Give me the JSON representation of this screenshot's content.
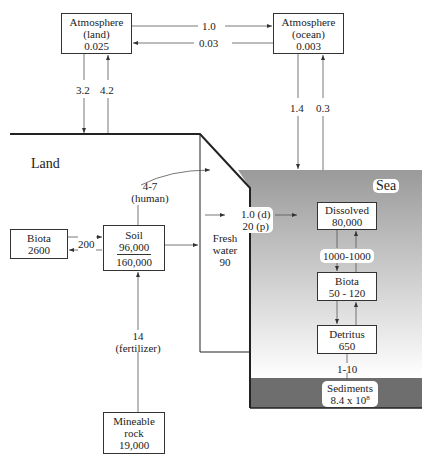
{
  "reservoirs": {
    "atmosphere_land": {
      "name": "Atmosphere",
      "sub": "(land)",
      "value": "0.025"
    },
    "atmosphere_ocean": {
      "name": "Atmosphere",
      "sub": "(ocean)",
      "value": "0.003"
    },
    "land_biota": {
      "name": "Biota",
      "value": "2600"
    },
    "soil": {
      "name": "Soil",
      "value_top": "96,000",
      "value_bottom": "160,000"
    },
    "mineable_rock": {
      "name": "Mineable",
      "name2": "rock",
      "value": "19,000"
    },
    "fresh_water": {
      "name": "Fresh",
      "name2": "water",
      "value": "90"
    },
    "dissolved": {
      "name": "Dissolved",
      "value": "80,000"
    },
    "sea_biota": {
      "name": "Biota",
      "value": "50 - 120"
    },
    "detritus": {
      "name": "Detritus",
      "value": "650"
    },
    "sediments": {
      "name": "Sediments",
      "value": "8.4 x 10",
      "exponent": "8"
    }
  },
  "regions": {
    "land": "Land",
    "sea": "Sea"
  },
  "fluxes": {
    "atm_land_to_ocean": "1.0",
    "atm_ocean_to_land": "0.03",
    "atm_land_down": "3.2",
    "atm_land_up": "4.2",
    "atm_ocean_down": "1.4",
    "atm_ocean_up": "0.3",
    "biota_soil": "200",
    "human_value": "4-7",
    "human_label": "(human)",
    "river_d": "1.0 (d)",
    "river_p": "20 (p)",
    "dissolved_biota": "1000-1000",
    "fertilizer_value": "14",
    "fertilizer_label": "(fertilizer)",
    "detritus_sediments": "1-10"
  },
  "colors": {
    "sea_top": "#9a9a9a",
    "sea_bottom": "#ffffff",
    "sediment": "#6e6e6e",
    "line": "#333333"
  }
}
